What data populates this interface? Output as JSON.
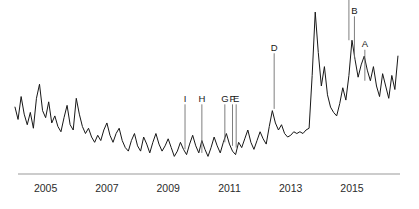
{
  "chart_data": {
    "type": "line",
    "title": "",
    "subtitle": "",
    "xlabel": "",
    "ylabel": "",
    "grid": false,
    "legend": "none",
    "xlim": [
      2004.0,
      2016.6
    ],
    "ylim": [
      0,
      100
    ],
    "axis": {
      "x_axis_visible": true,
      "y_axis_visible": false,
      "x_tick_labels": [
        "2005",
        "2007",
        "2009",
        "2011",
        "2013",
        "2015"
      ],
      "x_tick_values": [
        2005,
        2007,
        2009,
        2011,
        2013,
        2015
      ]
    },
    "series": [
      {
        "name": "value",
        "x": [
          2004.0,
          2004.1,
          2004.2,
          2004.3,
          2004.4,
          2004.5,
          2004.6,
          2004.7,
          2004.8,
          2004.9,
          2005.0,
          2005.1,
          2005.2,
          2005.3,
          2005.4,
          2005.5,
          2005.6,
          2005.7,
          2005.8,
          2005.9,
          2006.0,
          2006.1,
          2006.2,
          2006.3,
          2006.4,
          2006.5,
          2006.6,
          2006.7,
          2006.8,
          2006.9,
          2007.0,
          2007.1,
          2007.2,
          2007.3,
          2007.4,
          2007.5,
          2007.6,
          2007.7,
          2007.8,
          2007.9,
          2008.0,
          2008.1,
          2008.2,
          2008.3,
          2008.4,
          2008.5,
          2008.6,
          2008.7,
          2008.8,
          2008.9,
          2009.0,
          2009.1,
          2009.2,
          2009.3,
          2009.4,
          2009.5,
          2009.6,
          2009.7,
          2009.8,
          2009.9,
          2010.0,
          2010.1,
          2010.2,
          2010.3,
          2010.4,
          2010.5,
          2010.6,
          2010.7,
          2010.8,
          2010.9,
          2011.0,
          2011.1,
          2011.2,
          2011.3,
          2011.4,
          2011.5,
          2011.6,
          2011.7,
          2011.8,
          2011.9,
          2012.0,
          2012.1,
          2012.2,
          2012.3,
          2012.4,
          2012.5,
          2012.6,
          2012.7,
          2012.8,
          2012.9,
          2013.0,
          2013.1,
          2013.2,
          2013.3,
          2013.4,
          2013.5,
          2013.6,
          2013.7,
          2013.8,
          2013.9,
          2014.0,
          2014.1,
          2014.2,
          2014.3,
          2014.4,
          2014.5,
          2014.6,
          2014.7,
          2014.8,
          2014.9,
          2015.0,
          2015.1,
          2015.2,
          2015.3,
          2015.4,
          2015.5,
          2015.6,
          2015.7,
          2015.8,
          2015.9,
          2016.0,
          2016.1,
          2016.2,
          2016.3,
          2016.4,
          2016.5
        ],
        "values": [
          19.0,
          15.5,
          22.0,
          17.0,
          14.0,
          17.5,
          13.0,
          21.5,
          25.5,
          18.0,
          16.0,
          20.5,
          14.5,
          16.5,
          13.5,
          12.0,
          16.0,
          19.5,
          14.0,
          12.5,
          21.5,
          17.0,
          13.5,
          11.5,
          13.0,
          10.5,
          9.0,
          11.0,
          9.5,
          12.5,
          14.5,
          11.0,
          9.0,
          11.5,
          13.0,
          9.5,
          7.5,
          6.5,
          9.5,
          11.5,
          8.0,
          6.5,
          10.5,
          8.5,
          6.0,
          9.0,
          11.5,
          8.5,
          6.5,
          8.0,
          10.0,
          7.5,
          5.0,
          6.5,
          9.0,
          7.0,
          5.5,
          8.5,
          11.0,
          8.0,
          6.0,
          9.5,
          7.0,
          5.0,
          7.5,
          10.5,
          8.0,
          6.0,
          9.0,
          11.5,
          8.5,
          6.5,
          5.5,
          9.0,
          7.5,
          10.0,
          12.5,
          9.0,
          7.0,
          9.5,
          12.0,
          10.0,
          8.5,
          13.5,
          18.0,
          14.5,
          12.5,
          14.0,
          11.5,
          10.5,
          11.0,
          12.0,
          11.5,
          12.0,
          11.5,
          12.5,
          13.0,
          28.0,
          46.0,
          34.5,
          25.0,
          30.5,
          22.5,
          19.0,
          17.5,
          16.5,
          20.0,
          24.5,
          21.0,
          28.0,
          38.0,
          32.5,
          27.5,
          31.0,
          33.5,
          29.5,
          26.5,
          30.5,
          25.0,
          22.0,
          28.5,
          25.0,
          21.5,
          28.0,
          24.0,
          33.5
        ]
      }
    ],
    "annotations": [
      {
        "label": "A",
        "x": 2015.42,
        "text_y": 36.0,
        "anchor_y": 26.5
      },
      {
        "label": "B",
        "x": 2015.08,
        "text_y": 45.5,
        "anchor_y": 33.0
      },
      {
        "label": "C",
        "x": 2014.9,
        "text_y": 50.5,
        "anchor_y": 38.0
      },
      {
        "label": "D",
        "x": 2012.46,
        "text_y": 35.0,
        "anchor_y": 18.5
      },
      {
        "label": "E",
        "x": 2011.22,
        "text_y": 20.5,
        "anchor_y": 7.5
      },
      {
        "label": "F",
        "x": 2011.1,
        "text_y": 20.5,
        "anchor_y": 8.0
      },
      {
        "label": "G",
        "x": 2010.85,
        "text_y": 20.5,
        "anchor_y": 9.0
      },
      {
        "label": "H",
        "x": 2010.1,
        "text_y": 20.5,
        "anchor_y": 6.0
      },
      {
        "label": "I",
        "x": 2009.55,
        "text_y": 20.5,
        "anchor_y": 7.0
      }
    ],
    "colors": {
      "line": "#171717",
      "axis": "#9a9a9a",
      "text": "#2b2b2b",
      "annotation": "#171717",
      "leader": "#6f6f6f",
      "background": "#ffffff"
    }
  }
}
